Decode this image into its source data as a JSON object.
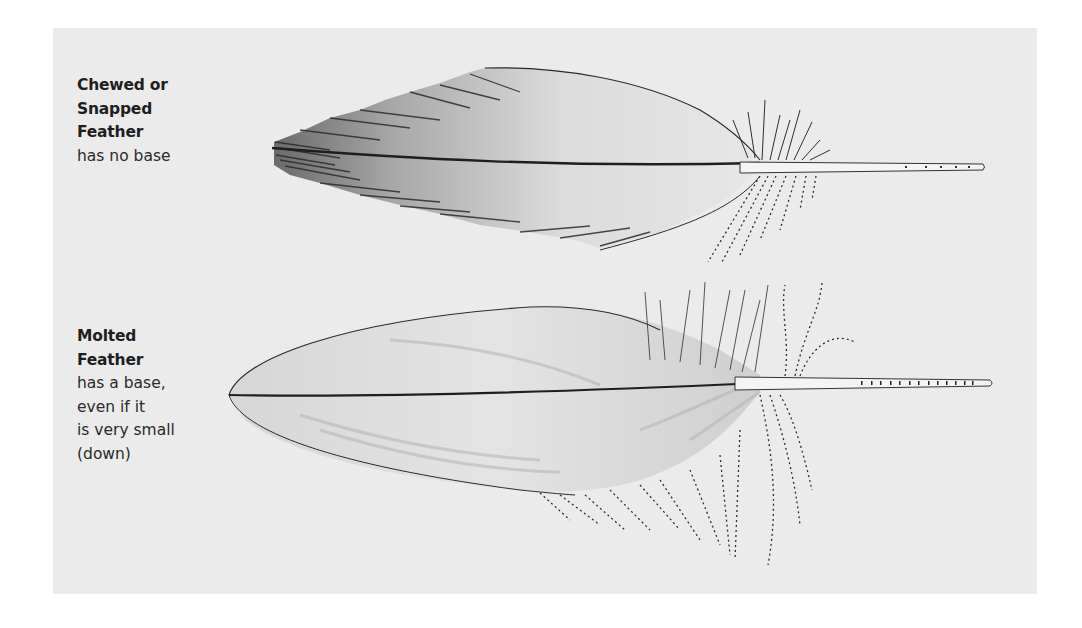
{
  "diagram": {
    "panel_background": "#ebebeb",
    "ink_color": "#1e1e1e",
    "feathers": [
      {
        "id": "chewed",
        "title_lines": [
          "Chewed or",
          "Snapped",
          "Feather"
        ],
        "description_lines": [
          "has no base"
        ],
        "illustration": "feather-broken-end-icon"
      },
      {
        "id": "molted",
        "title_lines": [
          "Molted",
          "Feather"
        ],
        "description_lines": [
          "has a base,",
          "even if it",
          "is very small",
          "(down)"
        ],
        "illustration": "feather-with-base-icon"
      }
    ]
  }
}
